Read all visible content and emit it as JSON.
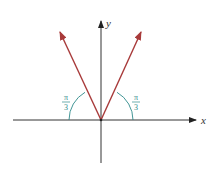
{
  "diagram": {
    "axes": {
      "x_label": "x",
      "y_label": "y"
    },
    "vectors": [
      {
        "name": "left-vector",
        "angle_from_negative_x": "π/3"
      },
      {
        "name": "right-vector",
        "angle_from_positive_x": "π/3"
      }
    ],
    "angle_labels": {
      "left": {
        "numerator": "π",
        "denominator": "3"
      },
      "right": {
        "numerator": "π",
        "denominator": "3"
      }
    },
    "colors": {
      "axis": "#333333",
      "vector": "#a83a3a",
      "arc": "#2e8a8a",
      "label": "#2e8a8a"
    }
  }
}
